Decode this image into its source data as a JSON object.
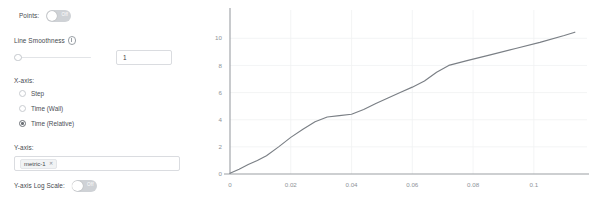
{
  "panel": {
    "points": {
      "label": "Points:",
      "toggle_state": "Off",
      "enabled": false
    },
    "line_smoothness": {
      "label": "Line Smoothness",
      "info_icon": "info-circle-icon",
      "slider_value": 0,
      "slider_min": 0,
      "slider_max": 1,
      "input_value": "1"
    },
    "x_axis": {
      "label": "X-axis:",
      "options": [
        {
          "label": "Step",
          "selected": false
        },
        {
          "label": "Time (Wall)",
          "selected": false
        },
        {
          "label": "Time (Relative)",
          "selected": true
        }
      ]
    },
    "y_axis": {
      "label": "Y-axis:",
      "chips": [
        {
          "text": "metric-1",
          "remove_icon": "close-icon"
        }
      ]
    },
    "y_log_scale": {
      "label": "Y-axis Log Scale:",
      "toggle_state": "Off",
      "enabled": false
    }
  },
  "chart_data": {
    "type": "line",
    "title": "",
    "xlabel": "",
    "ylabel": "",
    "xlim": [
      0,
      0.1175
    ],
    "ylim": [
      0,
      11.2
    ],
    "xticks": [
      0,
      0.02,
      0.04,
      0.06,
      0.08,
      0.1
    ],
    "xtick_labels": [
      "0",
      "0.02",
      "0.04",
      "0.06",
      "0.08",
      "0.1"
    ],
    "yticks": [
      0,
      2,
      4,
      6,
      8,
      10
    ],
    "ytick_labels": [
      "0",
      "2",
      "4",
      "6",
      "8",
      "10"
    ],
    "grid": true,
    "legend": "none",
    "series": [
      {
        "name": "metric-1",
        "color": "#7a7f85",
        "x": [
          0.0,
          0.003,
          0.006,
          0.009,
          0.012,
          0.016,
          0.02,
          0.024,
          0.028,
          0.032,
          0.036,
          0.04,
          0.044,
          0.048,
          0.052,
          0.056,
          0.06,
          0.064,
          0.068,
          0.072,
          0.078,
          0.086,
          0.094,
          0.102,
          0.11,
          0.1135
        ],
        "y": [
          0.05,
          0.35,
          0.7,
          1.0,
          1.35,
          2.0,
          2.7,
          3.3,
          3.85,
          4.2,
          4.3,
          4.4,
          4.75,
          5.2,
          5.6,
          6.0,
          6.4,
          6.85,
          7.5,
          8.0,
          8.35,
          8.8,
          9.25,
          9.7,
          10.2,
          10.45
        ]
      }
    ]
  }
}
